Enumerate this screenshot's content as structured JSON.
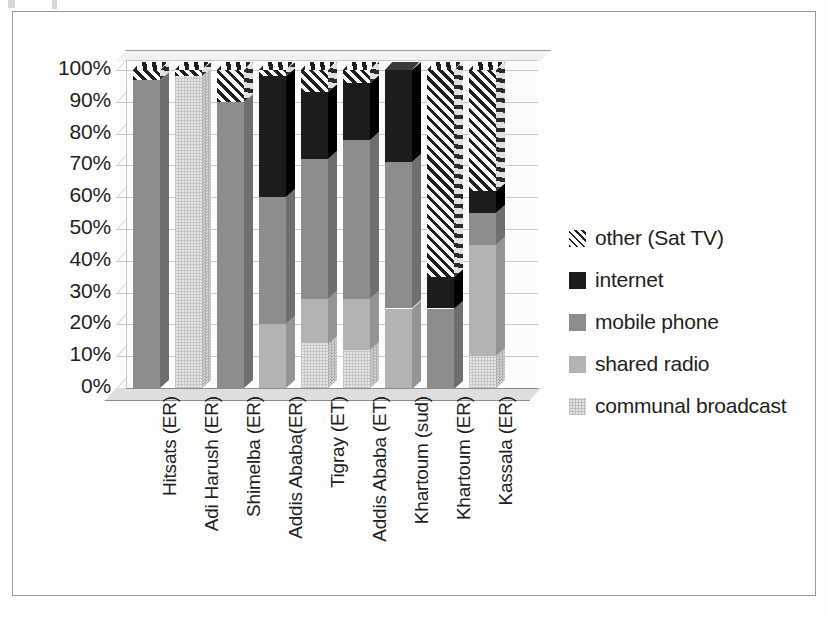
{
  "chart_data": {
    "type": "bar",
    "subtype": "stacked-100-percent-3d",
    "title": "",
    "xlabel": "",
    "ylabel": "",
    "ylim": [
      0,
      100
    ],
    "ytick_labels": [
      "100%",
      "90%",
      "80%",
      "70%",
      "60%",
      "50%",
      "40%",
      "30%",
      "20%",
      "10%",
      "0%"
    ],
    "ytick_values": [
      100,
      90,
      80,
      70,
      60,
      50,
      40,
      30,
      20,
      10,
      0
    ],
    "grid": true,
    "legend_position": "right",
    "categories": [
      "Hitsats (ER)",
      "Adi Harush (ER)",
      "Shimelba (ER)",
      "Addis Ababa(ER)",
      "Tigray (ET)",
      "Addis Ababa (ET)",
      "Khartoum (sud)",
      "Khartoum (ER)",
      "Kassala (ER)"
    ],
    "series": [
      {
        "name": "communal broadcast",
        "color": "#e6e6e6",
        "pattern": "dotted-grid",
        "values": [
          0,
          98,
          0,
          0,
          14,
          12,
          0,
          0,
          10
        ]
      },
      {
        "name": "shared radio",
        "color": "#b3b3b3",
        "pattern": "solid",
        "values": [
          0,
          0,
          0,
          20,
          14,
          16,
          25,
          0,
          35
        ]
      },
      {
        "name": "mobile phone",
        "color": "#8d8d8d",
        "pattern": "solid",
        "values": [
          97,
          0,
          90,
          40,
          44,
          50,
          46,
          25,
          10
        ]
      },
      {
        "name": "internet",
        "color": "#1c1c1c",
        "pattern": "solid",
        "values": [
          0,
          0,
          0,
          38,
          21,
          18,
          29,
          10,
          7
        ]
      },
      {
        "name": "other (Sat TV)",
        "color": "#ffffff",
        "pattern": "diagonal-hatch",
        "values": [
          3,
          2,
          10,
          2,
          7,
          4,
          0,
          65,
          38
        ]
      }
    ],
    "legend": [
      {
        "label": "other (Sat TV)",
        "swatch": "sw-other"
      },
      {
        "label": "internet",
        "swatch": "sw-internet"
      },
      {
        "label": "mobile phone",
        "swatch": "sw-mobile"
      },
      {
        "label": "shared radio",
        "swatch": "sw-shared"
      },
      {
        "label": "communal broadcast",
        "swatch": "sw-communal"
      }
    ]
  }
}
